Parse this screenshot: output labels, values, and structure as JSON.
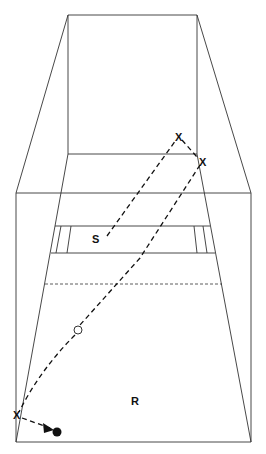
{
  "diagram": {
    "labels": {
      "S": "S",
      "R": "R",
      "X1": "X",
      "X2": "X",
      "X3": "X"
    },
    "markers": {
      "open_circle": "waypoint",
      "filled_circle": "endpoint"
    }
  }
}
